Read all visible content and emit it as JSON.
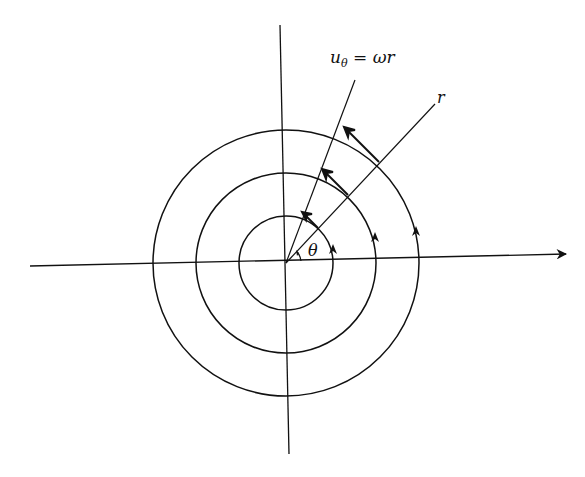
{
  "diagram": {
    "title": "",
    "colors": {
      "stroke": "#111111",
      "background": "#ffffff"
    },
    "center": [
      286,
      263
    ],
    "circles": [
      {
        "name": "inner",
        "radius": 47
      },
      {
        "name": "middle",
        "radius": 90
      },
      {
        "name": "outer",
        "radius": 133
      }
    ],
    "labels": {
      "velocity": "u",
      "velocity_sub": "θ",
      "velocity_eq": " = ωr",
      "radius": "r",
      "angle": "θ"
    },
    "axes": {
      "horizontal": {
        "x1": 30,
        "y1": 266,
        "x2": 566,
        "y2": 254,
        "arrow": true
      },
      "vertical": {
        "x1": 280,
        "y1": 25,
        "x2": 289,
        "y2": 454,
        "arrow": false
      }
    }
  }
}
